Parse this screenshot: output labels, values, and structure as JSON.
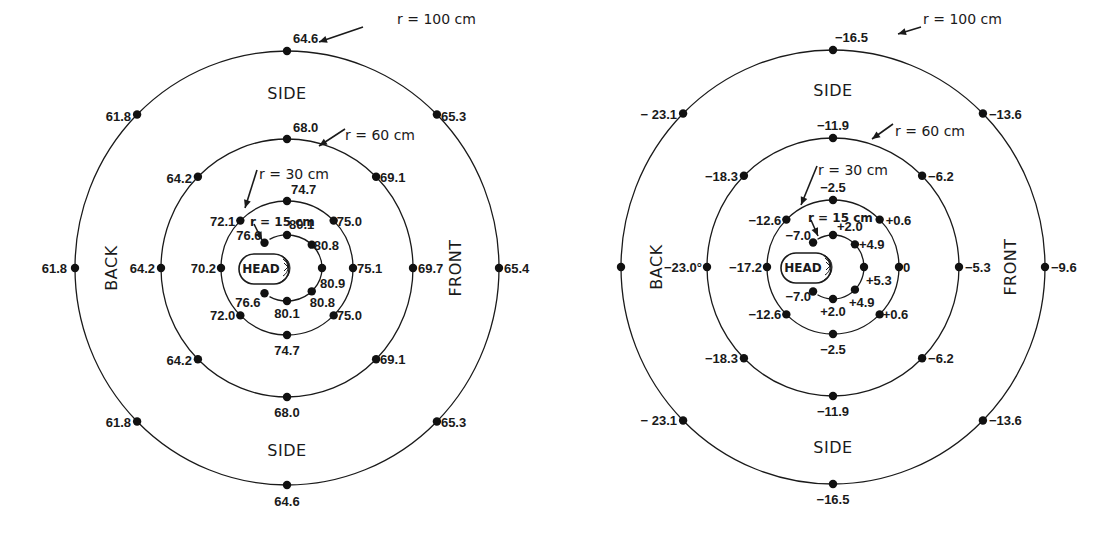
{
  "chart_data": [
    {
      "type": "polar-map",
      "id": "left",
      "center": [
        287,
        268
      ],
      "regions": {
        "top": "SIDE",
        "bottom": "SIDE",
        "left": "BACK",
        "right": "FRONT"
      },
      "head_label": "HEAD",
      "rings": [
        {
          "label": "r = 100 cm",
          "r_cm": 100,
          "rx": 212,
          "ry": 217,
          "label_pos": [
            397,
            19
          ],
          "arrow": [
            [
              363,
              27
            ],
            [
              319,
              42
            ]
          ],
          "points": [
            {
              "angle": 90,
              "value": "64.6",
              "dx": 6,
              "dy": -8,
              "anchor": "start"
            },
            {
              "angle": 45,
              "value": "65.3",
              "dx": 4,
              "dy": 6,
              "anchor": "start"
            },
            {
              "angle": 0,
              "value": "65.4",
              "dx": 5,
              "dy": 5,
              "anchor": "start"
            },
            {
              "angle": -45,
              "value": "65.3",
              "dx": 4,
              "dy": 6,
              "anchor": "start"
            },
            {
              "angle": -90,
              "value": "64.6",
              "dx": 0,
              "dy": 21,
              "anchor": "middle"
            },
            {
              "angle": -135,
              "value": "61.8",
              "dx": -6,
              "dy": 6,
              "anchor": "end"
            },
            {
              "angle": 180,
              "value": "61.8",
              "dx": -8,
              "dy": 5,
              "anchor": "end"
            },
            {
              "angle": 135,
              "value": "61.8",
              "dx": -6,
              "dy": 6,
              "anchor": "end"
            }
          ]
        },
        {
          "label": "r = 60 cm",
          "r_cm": 60,
          "rx": 126,
          "ry": 129,
          "label_pos": [
            345,
            135
          ],
          "arrow": [
            [
              345,
              129
            ],
            [
              319,
              146
            ]
          ],
          "points": [
            {
              "angle": 90,
              "value": "68.0",
              "dx": 6,
              "dy": -7,
              "anchor": "start"
            },
            {
              "angle": 45,
              "value": "69.1",
              "dx": 4,
              "dy": 5,
              "anchor": "start"
            },
            {
              "angle": 0,
              "value": "69.7",
              "dx": 5,
              "dy": 5,
              "anchor": "start"
            },
            {
              "angle": -45,
              "value": "69.1",
              "dx": 4,
              "dy": 5,
              "anchor": "start"
            },
            {
              "angle": -90,
              "value": "68.0",
              "dx": 0,
              "dy": 20,
              "anchor": "middle"
            },
            {
              "angle": -135,
              "value": "64.2",
              "dx": -6,
              "dy": 6,
              "anchor": "end"
            },
            {
              "angle": 180,
              "value": "64.2",
              "dx": -6,
              "dy": 5,
              "anchor": "end"
            },
            {
              "angle": 135,
              "value": "64.2",
              "dx": -6,
              "dy": 6,
              "anchor": "end"
            }
          ]
        },
        {
          "label": "r = 30 cm",
          "r_cm": 30,
          "rx": 66,
          "ry": 67,
          "label_pos": [
            259,
            174
          ],
          "arrow": [
            [
              257,
              170
            ],
            [
              245,
              208
            ]
          ],
          "points": [
            {
              "angle": 90,
              "value": "74.7",
              "dx": 4,
              "dy": -7,
              "anchor": "start"
            },
            {
              "angle": 45,
              "value": "75.0",
              "dx": 3,
              "dy": 5,
              "anchor": "start"
            },
            {
              "angle": 0,
              "value": "75.1",
              "dx": 4,
              "dy": 5,
              "anchor": "start"
            },
            {
              "angle": -45,
              "value": "75.0",
              "dx": 3,
              "dy": 5,
              "anchor": "start"
            },
            {
              "angle": -90,
              "value": "74.7",
              "dx": 0,
              "dy": 20,
              "anchor": "middle"
            },
            {
              "angle": -135,
              "value": "72.0",
              "dx": -5,
              "dy": 5,
              "anchor": "end"
            },
            {
              "angle": 180,
              "value": "70.2",
              "dx": -5,
              "dy": 5,
              "anchor": "end"
            },
            {
              "angle": 135,
              "value": "72.1",
              "dx": -5,
              "dy": 5,
              "anchor": "end"
            }
          ]
        },
        {
          "label": "r = 15 cm",
          "r_cm": 15,
          "rx": 35,
          "ry": 33,
          "arc_from_deg": 120,
          "arc_to_deg": -120,
          "label_pos": [
            250,
            221
          ],
          "arrow": [
            [
              254,
              224
            ],
            [
              262,
              240
            ]
          ],
          "points": [
            {
              "angle": 90,
              "value": "80.1",
              "dx": 2,
              "dy": -6,
              "anchor": "start"
            },
            {
              "angle": 45,
              "value": "80.8",
              "dx": 2,
              "dy": 5,
              "anchor": "start"
            },
            {
              "angle": 0,
              "value": "80.9",
              "dx": -2,
              "dy": 20,
              "anchor": "start"
            },
            {
              "angle": -45,
              "value": "80.8",
              "dx": -2,
              "dy": 16,
              "anchor": "start"
            },
            {
              "angle": -90,
              "value": "80.1",
              "dx": 0,
              "dy": 17,
              "anchor": "middle"
            },
            {
              "angle": -130,
              "value": "76.6",
              "dx": -4,
              "dy": 14,
              "anchor": "end"
            },
            {
              "angle": 130,
              "value": "76.6",
              "dx": -3,
              "dy": -3,
              "anchor": "end"
            }
          ]
        }
      ]
    },
    {
      "type": "polar-map",
      "id": "right",
      "center": [
        833,
        267
      ],
      "regions": {
        "top": "SIDE",
        "bottom": "SIDE",
        "left": "BACK",
        "right": "FRONT"
      },
      "head_label": "HEAD",
      "rings": [
        {
          "label": "r = 100 cm",
          "r_cm": 100,
          "rx": 212,
          "ry": 217,
          "label_pos": [
            923,
            19
          ],
          "arrow": [
            [
              921,
              27
            ],
            [
              898,
              34
            ]
          ],
          "points": [
            {
              "angle": 90,
              "value": "−16.5",
              "dx": 2,
              "dy": -8,
              "anchor": "start"
            },
            {
              "angle": 45,
              "value": "−13.6",
              "dx": 6,
              "dy": 5,
              "anchor": "start"
            },
            {
              "angle": 0,
              "value": "−9.6",
              "dx": 6,
              "dy": 5,
              "anchor": "start"
            },
            {
              "angle": -45,
              "value": "−13.6",
              "dx": 6,
              "dy": 5,
              "anchor": "start"
            },
            {
              "angle": -90,
              "value": "−16.5",
              "dx": 0,
              "dy": 20,
              "anchor": "middle"
            },
            {
              "angle": -135,
              "value": "− 23.1",
              "dx": -6,
              "dy": 5,
              "anchor": "end"
            },
            {
              "angle": 180,
              "value": "",
              "dx": 0,
              "dy": 0,
              "anchor": "end"
            },
            {
              "angle": 135,
              "value": "− 23.1",
              "dx": -6,
              "dy": 5,
              "anchor": "end"
            }
          ]
        },
        {
          "label": "r = 60 cm",
          "r_cm": 60,
          "rx": 126,
          "ry": 129,
          "label_pos": [
            895,
            131
          ],
          "arrow": [
            [
              893,
              124
            ],
            [
              872,
              139
            ]
          ],
          "points": [
            {
              "angle": 90,
              "value": "−11.9",
              "dx": 0,
              "dy": -8,
              "anchor": "middle"
            },
            {
              "angle": 45,
              "value": "−6.2",
              "dx": 6,
              "dy": 5,
              "anchor": "start"
            },
            {
              "angle": 0,
              "value": "−5.3",
              "dx": 6,
              "dy": 5,
              "anchor": "start"
            },
            {
              "angle": -45,
              "value": "−6.2",
              "dx": 6,
              "dy": 5,
              "anchor": "start"
            },
            {
              "angle": -90,
              "value": "−11.9",
              "dx": 0,
              "dy": 20,
              "anchor": "middle"
            },
            {
              "angle": -135,
              "value": "−18.3",
              "dx": -6,
              "dy": 5,
              "anchor": "end"
            },
            {
              "angle": 180,
              "value": "−23.0°",
              "dx": -5,
              "dy": 5,
              "anchor": "end"
            },
            {
              "angle": 135,
              "value": "−18.3",
              "dx": -6,
              "dy": 5,
              "anchor": "end"
            }
          ]
        },
        {
          "label": "r = 30 cm",
          "r_cm": 30,
          "rx": 66,
          "ry": 67,
          "label_pos": [
            818,
            170
          ],
          "arrow": [
            [
              817,
              166
            ],
            [
              801,
              205
            ]
          ],
          "points": [
            {
              "angle": 90,
              "value": "−2.5",
              "dx": 0,
              "dy": -8,
              "anchor": "middle"
            },
            {
              "angle": 45,
              "value": "+0.6",
              "dx": 6,
              "dy": 5,
              "anchor": "start"
            },
            {
              "angle": 0,
              "value": "0",
              "dx": 4,
              "dy": 5,
              "anchor": "start"
            },
            {
              "angle": -45,
              "value": "+0.6",
              "dx": 3,
              "dy": 5,
              "anchor": "start"
            },
            {
              "angle": -90,
              "value": "−2.5",
              "dx": 0,
              "dy": 20,
              "anchor": "middle"
            },
            {
              "angle": -135,
              "value": "−12.6",
              "dx": -5,
              "dy": 5,
              "anchor": "end"
            },
            {
              "angle": 180,
              "value": "−17.2",
              "dx": -5,
              "dy": 5,
              "anchor": "end"
            },
            {
              "angle": 135,
              "value": "−12.6",
              "dx": -5,
              "dy": 5,
              "anchor": "end"
            }
          ]
        },
        {
          "label": "r = 15 cm",
          "r_cm": 15,
          "rx": 31,
          "ry": 32,
          "arc_from_deg": 120,
          "arc_to_deg": -120,
          "label_pos": [
            808,
            217
          ],
          "arrow": [
            [
              811,
              220
            ],
            [
              818,
              236
            ]
          ],
          "points": [
            {
              "angle": 90,
              "value": "+2.0",
              "dx": 4,
              "dy": -4,
              "anchor": "start"
            },
            {
              "angle": 45,
              "value": "+4.9",
              "dx": 4,
              "dy": 5,
              "anchor": "start"
            },
            {
              "angle": 0,
              "value": "+5.3",
              "dx": 2,
              "dy": 18,
              "anchor": "start"
            },
            {
              "angle": -45,
              "value": "+4.9",
              "dx": -6,
              "dy": 17,
              "anchor": "start"
            },
            {
              "angle": -90,
              "value": "+2.0",
              "dx": 0,
              "dy": 17,
              "anchor": "middle"
            },
            {
              "angle": -130,
              "value": "−7.0",
              "dx": -2,
              "dy": 9,
              "anchor": "end"
            },
            {
              "angle": 130,
              "value": "−7.0",
              "dx": -2,
              "dy": -2,
              "anchor": "end"
            }
          ]
        }
      ]
    }
  ],
  "labels": {
    "left": {
      "side_top": "SIDE",
      "side_bottom": "SIDE",
      "back": "BACK",
      "front": "FRONT",
      "head": "HEAD"
    },
    "right": {
      "side_top": "SIDE",
      "side_bottom": "SIDE",
      "back": "BACK",
      "front": "FRONT",
      "head": "HEAD"
    }
  }
}
